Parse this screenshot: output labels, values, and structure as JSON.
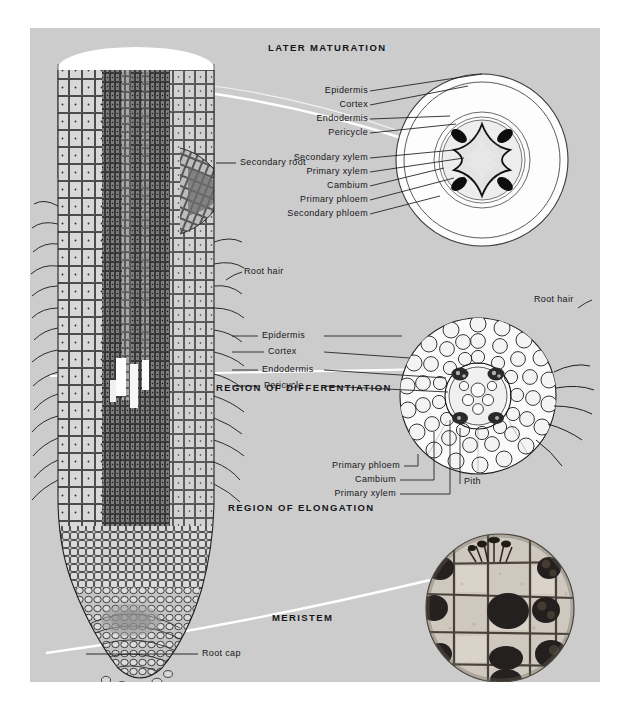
{
  "plate": {
    "background_color": "#cccccc",
    "page_background": "#ffffff",
    "ink_color": "#14161a",
    "connector_color": "#ffffff"
  },
  "regions": [
    {
      "name": "later-maturation",
      "label": "LATER MATURATION"
    },
    {
      "name": "region-of-differentiation",
      "label": "REGION OF DIFFERENTIATION"
    },
    {
      "name": "region-of-elongation",
      "label": "REGION OF ELONGATION"
    },
    {
      "name": "meristem",
      "label": "MERISTEM"
    }
  ],
  "top_section_labels": [
    {
      "name": "epidermis",
      "label": "Epidermis"
    },
    {
      "name": "cortex",
      "label": "Cortex"
    },
    {
      "name": "endodermis",
      "label": "Endodermis"
    },
    {
      "name": "pericycle",
      "label": "Pericycle"
    },
    {
      "name": "secondary-xylem",
      "label": "Secondary xylem"
    },
    {
      "name": "primary-xylem",
      "label": "Primary xylem"
    },
    {
      "name": "cambium",
      "label": "Cambium"
    },
    {
      "name": "primary-phloem",
      "label": "Primary phloem"
    },
    {
      "name": "secondary-phloem",
      "label": "Secondary phloem"
    }
  ],
  "middle_section_labels": [
    {
      "name": "epidermis",
      "label": "Epidermis"
    },
    {
      "name": "cortex",
      "label": "Cortex"
    },
    {
      "name": "endodermis",
      "label": "Endodermis"
    },
    {
      "name": "pericycle",
      "label": "Pericycle"
    }
  ],
  "middle_lower_labels": [
    {
      "name": "primary-phloem",
      "label": "Primary phloem"
    },
    {
      "name": "cambium",
      "label": "Cambium"
    },
    {
      "name": "primary-xylem",
      "label": "Primary xylem"
    }
  ],
  "middle_pith_label": {
    "name": "pith",
    "label": "Pith"
  },
  "root_labels": {
    "secondary_root": "Secondary root",
    "root_hair_left": "Root hair",
    "root_hair_right": "Root hair",
    "root_cap": "Root cap"
  }
}
